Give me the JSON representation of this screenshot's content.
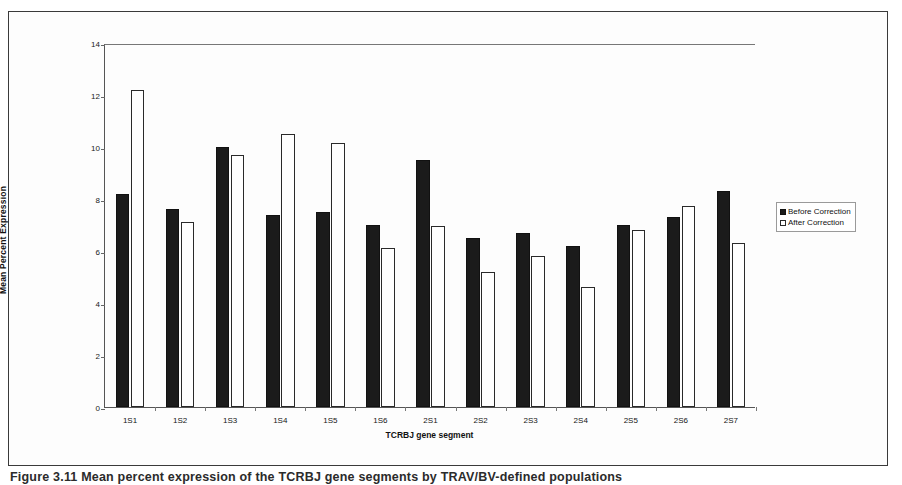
{
  "figure": {
    "caption": "Figure 3.11  Mean percent expression of the TCRBJ gene segments by TRAV/BV-defined populations"
  },
  "chart_data": {
    "type": "bar",
    "title": "",
    "xlabel": "TCRBJ gene segment",
    "ylabel": "Mean Percent Expression",
    "categories": [
      "1S1",
      "1S2",
      "1S3",
      "1S4",
      "1S5",
      "1S6",
      "2S1",
      "2S2",
      "2S3",
      "2S4",
      "2S5",
      "2S6",
      "2S7"
    ],
    "series": [
      {
        "name": "Before Correction",
        "color": "#1b1b1b",
        "values": [
          8.2,
          7.6,
          10.0,
          7.4,
          7.5,
          7.0,
          9.5,
          6.5,
          6.7,
          6.2,
          7.0,
          7.3,
          8.3
        ]
      },
      {
        "name": "After Correction",
        "color": "#ffffff",
        "values": [
          12.2,
          7.1,
          9.7,
          10.5,
          10.15,
          6.1,
          6.95,
          5.2,
          5.8,
          4.6,
          6.8,
          7.75,
          6.3
        ]
      }
    ],
    "ylim": [
      0,
      14
    ],
    "yticks": [
      0,
      2,
      4,
      6,
      8,
      10,
      12,
      14
    ],
    "grid": false,
    "legend_position": "right"
  },
  "legend": {
    "items": [
      {
        "label": "Before Correction",
        "marker": "filled-square"
      },
      {
        "label": "After Correction",
        "marker": "open-square"
      }
    ]
  }
}
